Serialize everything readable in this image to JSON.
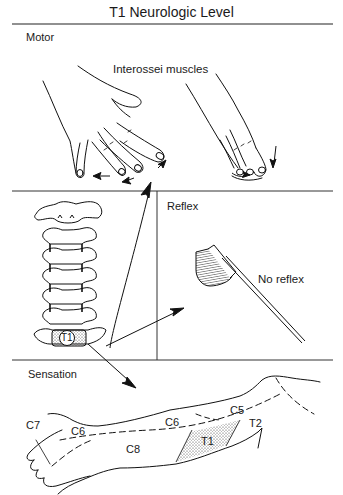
{
  "title": "T1 Neurologic Level",
  "sections": {
    "motor": {
      "label": "Motor",
      "muscle_label": "Interossei muscles",
      "illustrations": [
        "hand-finger-abduction",
        "hand-finger-adduction"
      ]
    },
    "reflex": {
      "label": "Reflex",
      "result_label": "No reflex",
      "illustrations": [
        "reflex-hammer"
      ]
    },
    "spine": {
      "vertebra_label": "T1"
    },
    "sensation": {
      "label": "Sensation",
      "dermatomes": [
        {
          "id": "c7",
          "label": "C7"
        },
        {
          "id": "c6-hand",
          "label": "C6"
        },
        {
          "id": "c6-forearm",
          "label": "C6"
        },
        {
          "id": "c8",
          "label": "C8"
        },
        {
          "id": "c5",
          "label": "C5"
        },
        {
          "id": "t1",
          "label": "T1",
          "highlighted": true
        },
        {
          "id": "t2",
          "label": "T2"
        }
      ]
    }
  },
  "colors": {
    "line": "#1a1a1a",
    "background": "#ffffff"
  }
}
